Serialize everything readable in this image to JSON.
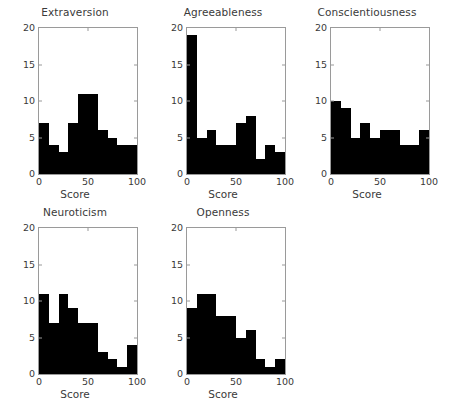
{
  "figure": {
    "background": "#ffffff",
    "bar_color": "#000000",
    "axis_color": "#9a9a9a",
    "text_color": "#3a3a3a",
    "grid": false,
    "layout": "2 rows x 3 columns, bottom-right cell empty"
  },
  "chart_data": [
    {
      "type": "bar",
      "title": "Extraversion",
      "xlabel": "Score",
      "ylabel": "",
      "xlim": [
        0,
        100
      ],
      "ylim": [
        0,
        20
      ],
      "xticks": [
        0,
        50,
        100
      ],
      "yticks": [
        0,
        5,
        10,
        15,
        20
      ],
      "xtick_labels": [
        "0",
        "50",
        "100"
      ],
      "ytick_labels": [
        "0",
        "5",
        "10",
        "15",
        "20"
      ],
      "bin_edges": [
        0,
        10,
        20,
        30,
        40,
        50,
        60,
        70,
        80,
        90,
        100
      ],
      "categories": [
        "0-10",
        "10-20",
        "20-30",
        "30-40",
        "40-50",
        "50-60",
        "60-70",
        "70-80",
        "80-90",
        "90-100"
      ],
      "values": [
        7,
        4,
        3,
        7,
        11,
        11,
        6,
        5,
        4,
        4
      ],
      "grid": false,
      "legend": null
    },
    {
      "type": "bar",
      "title": "Agreeableness",
      "xlabel": "Score",
      "ylabel": "",
      "xlim": [
        0,
        100
      ],
      "ylim": [
        0,
        20
      ],
      "xticks": [
        0,
        50,
        100
      ],
      "yticks": [
        0,
        5,
        10,
        15,
        20
      ],
      "xtick_labels": [
        "0",
        "50",
        "100"
      ],
      "ytick_labels": [
        "0",
        "5",
        "10",
        "15",
        "20"
      ],
      "bin_edges": [
        0,
        10,
        20,
        30,
        40,
        50,
        60,
        70,
        80,
        90,
        100
      ],
      "categories": [
        "0-10",
        "10-20",
        "20-30",
        "30-40",
        "40-50",
        "50-60",
        "60-70",
        "70-80",
        "80-90",
        "90-100"
      ],
      "values": [
        19,
        5,
        6,
        4,
        4,
        7,
        8,
        2,
        4,
        3
      ],
      "grid": false,
      "legend": null
    },
    {
      "type": "bar",
      "title": "Conscientiousness",
      "xlabel": "Score",
      "ylabel": "",
      "xlim": [
        0,
        100
      ],
      "ylim": [
        0,
        20
      ],
      "xticks": [
        0,
        50,
        100
      ],
      "yticks": [
        0,
        5,
        10,
        15,
        20
      ],
      "xtick_labels": [
        "0",
        "50",
        "100"
      ],
      "ytick_labels": [
        "0",
        "5",
        "10",
        "15",
        "20"
      ],
      "bin_edges": [
        0,
        10,
        20,
        30,
        40,
        50,
        60,
        70,
        80,
        90,
        100
      ],
      "categories": [
        "0-10",
        "10-20",
        "20-30",
        "30-40",
        "40-50",
        "50-60",
        "60-70",
        "70-80",
        "80-90",
        "90-100"
      ],
      "values": [
        10,
        9,
        5,
        7,
        5,
        6,
        6,
        4,
        4,
        6
      ],
      "grid": false,
      "legend": null
    },
    {
      "type": "bar",
      "title": "Neuroticism",
      "xlabel": "Score",
      "ylabel": "",
      "xlim": [
        0,
        100
      ],
      "ylim": [
        0,
        20
      ],
      "xticks": [
        0,
        50,
        100
      ],
      "yticks": [
        0,
        5,
        10,
        15,
        20
      ],
      "xtick_labels": [
        "0",
        "50",
        "100"
      ],
      "ytick_labels": [
        "0",
        "5",
        "10",
        "15",
        "20"
      ],
      "bin_edges": [
        0,
        10,
        20,
        30,
        40,
        50,
        60,
        70,
        80,
        90,
        100
      ],
      "categories": [
        "0-10",
        "10-20",
        "20-30",
        "30-40",
        "40-50",
        "50-60",
        "60-70",
        "70-80",
        "80-90",
        "90-100"
      ],
      "values": [
        11,
        7,
        11,
        9,
        7,
        7,
        3,
        2,
        1,
        4
      ],
      "grid": false,
      "legend": null
    },
    {
      "type": "bar",
      "title": "Openness",
      "xlabel": "Score",
      "ylabel": "",
      "xlim": [
        0,
        100
      ],
      "ylim": [
        0,
        20
      ],
      "xticks": [
        0,
        50,
        100
      ],
      "yticks": [
        0,
        5,
        10,
        15,
        20
      ],
      "xtick_labels": [
        "0",
        "50",
        "100"
      ],
      "ytick_labels": [
        "0",
        "5",
        "10",
        "15",
        "20"
      ],
      "bin_edges": [
        0,
        10,
        20,
        30,
        40,
        50,
        60,
        70,
        80,
        90,
        100
      ],
      "categories": [
        "0-10",
        "10-20",
        "20-30",
        "30-40",
        "40-50",
        "50-60",
        "60-70",
        "70-80",
        "80-90",
        "90-100"
      ],
      "values": [
        9,
        11,
        11,
        8,
        8,
        5,
        6,
        2,
        1,
        2
      ],
      "grid": false,
      "legend": null
    }
  ]
}
